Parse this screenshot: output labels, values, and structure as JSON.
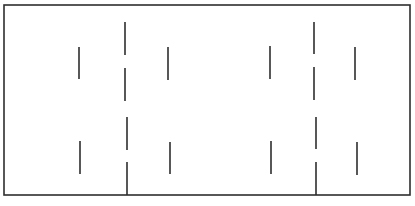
{
  "diagram": {
    "width": 415,
    "height": 206,
    "stroke_color": "#2e2e2e",
    "frame": {
      "x1": 4,
      "y1": 5,
      "x2": 410,
      "y2": 195,
      "stroke_width": 1.6
    },
    "dashed_lines": [
      {
        "id": "center-line-left",
        "segments": [
          [
            125,
            22,
            125,
            55
          ],
          [
            125,
            68,
            125,
            101
          ],
          [
            127,
            117,
            127,
            150
          ],
          [
            127,
            162,
            127,
            195
          ]
        ]
      },
      {
        "id": "center-line-right",
        "segments": [
          [
            314,
            22,
            314,
            54
          ],
          [
            314,
            67,
            314,
            100
          ],
          [
            316,
            117,
            316,
            149
          ],
          [
            316,
            162,
            316,
            195
          ]
        ]
      }
    ],
    "ticks": [
      {
        "id": "tick-upper-1",
        "x": 79,
        "y1": 47,
        "y2": 79
      },
      {
        "id": "tick-upper-2",
        "x": 168,
        "y1": 47,
        "y2": 80
      },
      {
        "id": "tick-upper-3",
        "x": 270,
        "y1": 46,
        "y2": 79
      },
      {
        "id": "tick-upper-4",
        "x": 355,
        "y1": 47,
        "y2": 80
      },
      {
        "id": "tick-lower-1",
        "x": 80,
        "y1": 141,
        "y2": 174
      },
      {
        "id": "tick-lower-2",
        "x": 170,
        "y1": 142,
        "y2": 174
      },
      {
        "id": "tick-lower-3",
        "x": 271,
        "y1": 141,
        "y2": 174
      },
      {
        "id": "tick-lower-4",
        "x": 357,
        "y1": 142,
        "y2": 175
      }
    ]
  }
}
